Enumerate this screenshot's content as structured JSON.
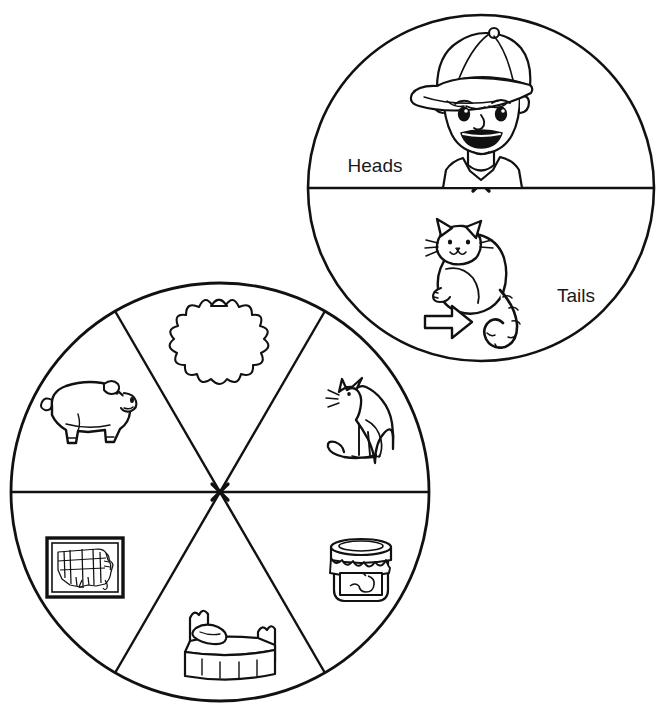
{
  "page": {
    "background": "#ffffff",
    "ink": "#111111",
    "width": 671,
    "height": 727
  },
  "coin": {
    "name": "coin-diagram",
    "center_x": 481,
    "center_y": 188,
    "radius": 173,
    "divider_y": 188,
    "center_mark": "x-mark",
    "outcomes": [
      {
        "label": "Heads",
        "label_x": 375,
        "label_y": 172,
        "icon": "boy-with-cap-icon",
        "icon_description": "smiling boy wearing a baseball cap"
      },
      {
        "label": "Tails",
        "label_x": 576,
        "label_y": 302,
        "icon": "cat-with-tail-icon",
        "icon_description": "cartoon cat with striped curling tail",
        "pointer": "arrow-right-icon"
      }
    ]
  },
  "spinner": {
    "name": "spinner-diagram",
    "center_x": 220,
    "center_y": 492,
    "radius": 209,
    "center_mark": "x-mark",
    "sector_count": 6,
    "sector_angle_degrees": 60,
    "sectors": [
      {
        "position": "top",
        "icon": "sun-icon",
        "icon_description": "sun with wavy flame rays",
        "icon_x": 211,
        "icon_y": 336,
        "angle_center_deg": 270
      },
      {
        "position": "upper-right",
        "icon": "cat-icon",
        "icon_description": "sitting cat in profile",
        "icon_x": 355,
        "icon_y": 415,
        "angle_center_deg": 330
      },
      {
        "position": "lower-right",
        "icon": "jam-jar-icon",
        "icon_description": "jar of jam with cloth cover",
        "icon_x": 360,
        "icon_y": 568,
        "angle_center_deg": 30
      },
      {
        "position": "bottom",
        "icon": "bed-icon",
        "icon_description": "bed with pillow and blanket",
        "icon_x": 222,
        "icon_y": 645,
        "angle_center_deg": 90
      },
      {
        "position": "lower-left",
        "icon": "us-map-icon",
        "icon_description": "framed map of United States",
        "icon_x": 82,
        "icon_y": 568,
        "angle_center_deg": 150
      },
      {
        "position": "upper-left",
        "icon": "pig-icon",
        "icon_description": "pig standing in profile",
        "icon_x": 85,
        "icon_y": 413,
        "angle_center_deg": 210
      }
    ]
  }
}
